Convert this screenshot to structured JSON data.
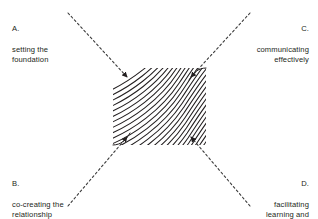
{
  "figure": {
    "kind": "four-quadrant-flow-diagram",
    "background_color": "#ffffff",
    "line_color": "#231f20",
    "dash_color": "#3a3a3a",
    "text_color": "#231f20"
  },
  "center_region": {
    "name": "hatched-core",
    "x": 113,
    "y": 68,
    "width": 93,
    "height": 77,
    "fill_pattern": "curved-flow-lines",
    "flow_line_count": 26
  },
  "labels": {
    "a": {
      "letter": "A.",
      "text": "setting the\nfoundation",
      "corner": "top-left"
    },
    "b": {
      "letter": "B.",
      "text": "co-creating the\nrelationship",
      "corner": "bottom-left"
    },
    "c": {
      "letter": "C.",
      "text": "communicating\neffectively",
      "corner": "top-right"
    },
    "d": {
      "letter": "D.",
      "text": "facilitating\nlearning and\nresults",
      "corner": "bottom-right"
    }
  },
  "connectors": [
    {
      "name": "connector-a",
      "from_corner": "top-left",
      "to_corner_of_core": "top-left",
      "style": "dashed",
      "arrowhead": "inward"
    },
    {
      "name": "connector-c",
      "from_corner": "top-right",
      "to_corner_of_core": "top-right",
      "style": "dashed",
      "arrowhead": "inward"
    },
    {
      "name": "connector-b",
      "from_corner": "bottom-left",
      "to_corner_of_core": "bottom-left",
      "style": "dashed",
      "arrowhead": "inward"
    },
    {
      "name": "connector-d",
      "from_corner": "bottom-right",
      "to_corner_of_core": "bottom-right",
      "style": "dashed",
      "arrowhead": "inward"
    }
  ]
}
